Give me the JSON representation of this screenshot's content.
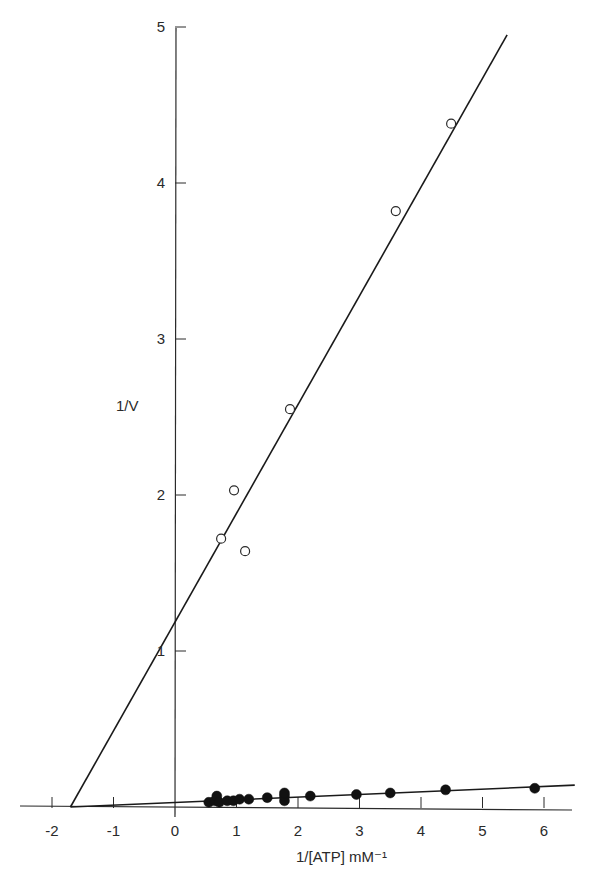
{
  "chart_data": {
    "type": "scatter",
    "title": "",
    "xlabel": "1/[ATP] mM⁻¹",
    "ylabel": "1/V",
    "xlim": [
      -2.3,
      6.5
    ],
    "ylim": [
      0,
      5
    ],
    "x_ticks": [
      "-2",
      "-1",
      "0",
      "1",
      "2",
      "3",
      "4",
      "5",
      "6"
    ],
    "y_ticks": [
      "1",
      "2",
      "3",
      "4",
      "5"
    ],
    "grid": false,
    "legend": null,
    "series": [
      {
        "name": "open circles",
        "marker": "open-circle",
        "points": [
          {
            "x": 0.75,
            "y": 1.72
          },
          {
            "x": 0.96,
            "y": 2.03
          },
          {
            "x": 1.14,
            "y": 1.64
          },
          {
            "x": 1.87,
            "y": 2.55
          },
          {
            "x": 3.59,
            "y": 3.82
          },
          {
            "x": 4.49,
            "y": 4.38
          }
        ],
        "fit_line": {
          "x_intercept": -1.7,
          "y_intercept": 1.28,
          "x_end": 5.4,
          "y_end": 4.95
        }
      },
      {
        "name": "filled circles",
        "marker": "filled-circle",
        "points": [
          {
            "x": 0.55,
            "y": 0.03
          },
          {
            "x": 0.65,
            "y": 0.04
          },
          {
            "x": 0.68,
            "y": 0.07
          },
          {
            "x": 0.72,
            "y": 0.03
          },
          {
            "x": 0.85,
            "y": 0.04
          },
          {
            "x": 0.95,
            "y": 0.04
          },
          {
            "x": 1.05,
            "y": 0.05
          },
          {
            "x": 1.2,
            "y": 0.05
          },
          {
            "x": 1.5,
            "y": 0.06
          },
          {
            "x": 1.78,
            "y": 0.04
          },
          {
            "x": 1.78,
            "y": 0.07
          },
          {
            "x": 1.78,
            "y": 0.09
          },
          {
            "x": 2.2,
            "y": 0.07
          },
          {
            "x": 2.95,
            "y": 0.08
          },
          {
            "x": 3.5,
            "y": 0.09
          },
          {
            "x": 4.4,
            "y": 0.11
          },
          {
            "x": 5.85,
            "y": 0.12
          }
        ],
        "fit_line": {
          "x_intercept": -1.7,
          "y_intercept": 0.03,
          "x_end": 6.5,
          "y_end": 0.14
        }
      }
    ]
  },
  "axes": {
    "x_title": "1/[ATP] mM⁻¹",
    "y_title": "1/V"
  }
}
